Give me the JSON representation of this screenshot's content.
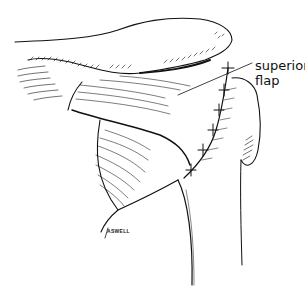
{
  "figure": {
    "labels": [
      {
        "id": "superior-flap",
        "line1": "superior",
        "line2": "flap"
      }
    ],
    "signature": "ASWELL",
    "colors": {
      "ink": "#111111",
      "background": "#ffffff"
    }
  }
}
